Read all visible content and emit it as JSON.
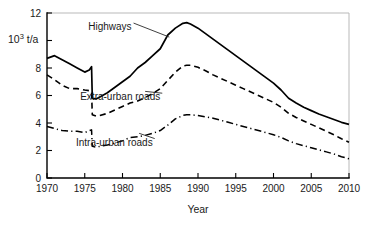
{
  "chart_data": {
    "type": "line",
    "title": "",
    "xlabel": "Year",
    "ylabel": "10^3 t/a",
    "ylabel_mantissa": "10",
    "ylabel_exponent": "3",
    "ylabel_unit": " t/a",
    "xlim": [
      1970,
      2010
    ],
    "ylim": [
      0,
      12
    ],
    "grid": false,
    "legend_position": "inline-annotations",
    "xticks": [
      1970,
      1975,
      1980,
      1985,
      1990,
      1995,
      2000,
      2005,
      2010
    ],
    "xtick_labels": [
      "1970",
      "1975",
      "1980",
      "1985",
      "1990",
      "1995",
      "2000",
      "2005",
      "2010"
    ],
    "yticks": [
      0,
      2,
      4,
      6,
      8,
      10,
      12
    ],
    "ytick_labels": [
      "0",
      "2",
      "4",
      "6",
      "8",
      "",
      "12"
    ],
    "x": [
      1970,
      1971,
      1972,
      1973,
      1974,
      1975,
      1975.6,
      1975.9,
      1976,
      1976.5,
      1977,
      1978,
      1979,
      1980,
      1981,
      1982,
      1983,
      1984,
      1985,
      1986,
      1987,
      1988,
      1988.5,
      1989,
      1990,
      1991,
      1992,
      1993,
      1994,
      1995,
      1996,
      1997,
      1998,
      1999,
      2000,
      2001,
      2002,
      2003,
      2004,
      2005,
      2006,
      2007,
      2008,
      2009,
      2010
    ],
    "series": [
      {
        "name": "Highways",
        "style": "solid",
        "color": "#000000",
        "values": [
          8.7,
          8.9,
          8.6,
          8.3,
          8.0,
          7.7,
          7.85,
          8.1,
          5.8,
          5.75,
          5.9,
          6.2,
          6.6,
          7.0,
          7.4,
          8.0,
          8.4,
          8.9,
          9.4,
          10.4,
          10.9,
          11.25,
          11.3,
          11.2,
          10.9,
          10.5,
          10.1,
          9.7,
          9.3,
          8.9,
          8.5,
          8.1,
          7.7,
          7.3,
          6.9,
          6.4,
          5.8,
          5.45,
          5.15,
          4.9,
          4.65,
          4.45,
          4.25,
          4.05,
          3.9
        ]
      },
      {
        "name": "Extra-urban roads",
        "style": "dashed",
        "color": "#000000",
        "values": [
          7.5,
          7.15,
          6.75,
          6.5,
          6.5,
          6.4,
          6.35,
          6.3,
          4.6,
          4.5,
          4.55,
          4.7,
          4.95,
          5.2,
          5.45,
          5.6,
          5.85,
          6.15,
          6.5,
          7.1,
          7.7,
          8.15,
          8.2,
          8.2,
          8.05,
          7.8,
          7.5,
          7.25,
          7.0,
          6.75,
          6.5,
          6.25,
          6.0,
          5.75,
          5.5,
          5.15,
          4.7,
          4.4,
          4.15,
          3.9,
          3.65,
          3.4,
          3.15,
          2.85,
          2.6
        ]
      },
      {
        "name": "Intra-urban roads",
        "style": "dashdot",
        "color": "#000000",
        "values": [
          3.75,
          3.6,
          3.45,
          3.4,
          3.4,
          3.3,
          3.45,
          3.5,
          2.3,
          2.25,
          2.3,
          2.4,
          2.55,
          2.7,
          2.95,
          3.0,
          3.1,
          3.25,
          3.45,
          3.85,
          4.3,
          4.55,
          4.6,
          4.6,
          4.55,
          4.45,
          4.35,
          4.2,
          4.05,
          3.9,
          3.75,
          3.6,
          3.45,
          3.3,
          3.15,
          2.95,
          2.7,
          2.5,
          2.35,
          2.2,
          2.05,
          1.9,
          1.75,
          1.55,
          1.4
        ]
      }
    ],
    "annotations": [
      {
        "id": "highways",
        "text": "Highways",
        "x": 1981.2,
        "y": 11.05,
        "anchor_x": 1986.2,
        "anchor_y": 10.25
      },
      {
        "id": "extra-urban",
        "text": "Extra-urban roads",
        "x": 1985.0,
        "y": 5.95,
        "anchor_x": 1983.0,
        "anchor_y": 6.3
      },
      {
        "id": "intra-urban",
        "text": "Intra-urban roads",
        "x": 1984.0,
        "y": 2.65,
        "anchor_x": 1982.2,
        "anchor_y": 3.25
      }
    ]
  }
}
